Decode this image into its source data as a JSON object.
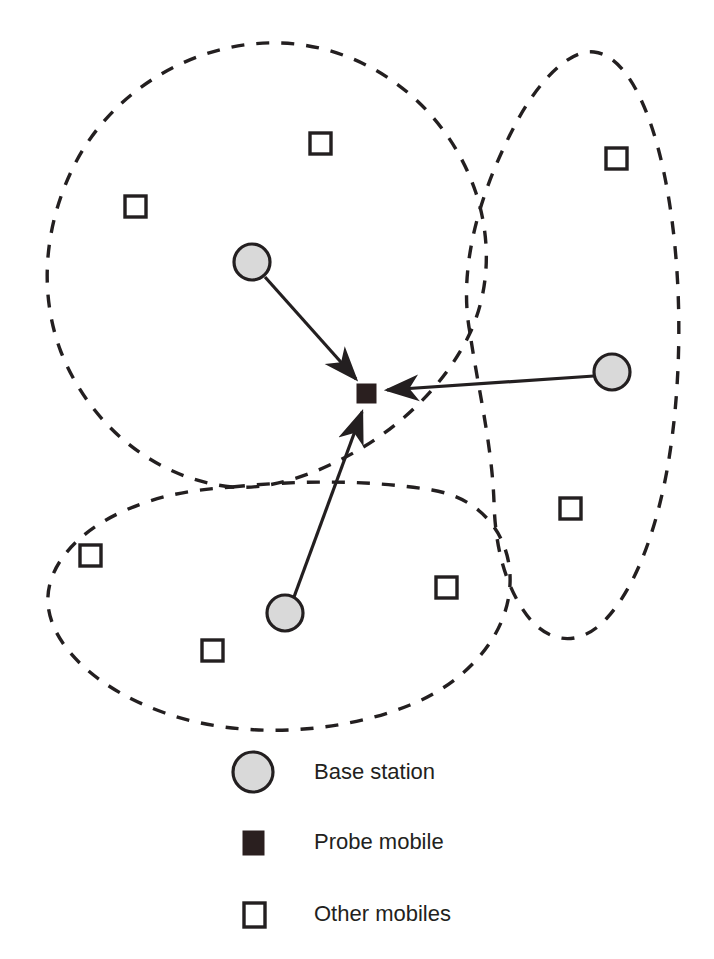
{
  "figure": {
    "background_color": "#ffffff",
    "ink_color": "#231f20",
    "base_station_fill": "#d9d9d9",
    "probe_fill": "#2a1f1f",
    "mobile_fill": "#ffffff"
  },
  "legend": {
    "items": [
      {
        "symbol": "circle",
        "label": "Base station"
      },
      {
        "symbol": "filled-square",
        "label": "Probe mobile"
      },
      {
        "symbol": "open-square",
        "label": "Other mobiles"
      }
    ]
  },
  "diagram": {
    "cells": [
      {
        "name": "upper-left-cell",
        "style": "dashed"
      },
      {
        "name": "right-cell",
        "style": "dashed"
      },
      {
        "name": "lower-left-cell",
        "style": "dashed"
      }
    ],
    "base_stations": [
      {
        "name": "base-station-upper-left",
        "x": 252,
        "y": 262,
        "r": 18
      },
      {
        "name": "base-station-right",
        "x": 612,
        "y": 372,
        "r": 18
      },
      {
        "name": "base-station-lower-left",
        "x": 285,
        "y": 613,
        "r": 18
      }
    ],
    "probe_mobile": {
      "name": "probe-mobile",
      "x": 367,
      "y": 393,
      "size": 19
    },
    "other_mobiles": [
      {
        "x": 320,
        "y": 143,
        "size": 21
      },
      {
        "x": 135,
        "y": 206,
        "size": 21
      },
      {
        "x": 616,
        "y": 158,
        "size": 21
      },
      {
        "x": 570,
        "y": 508,
        "size": 21
      },
      {
        "x": 90,
        "y": 555,
        "size": 21
      },
      {
        "x": 446,
        "y": 587,
        "size": 21
      },
      {
        "x": 212,
        "y": 650,
        "size": 21
      }
    ],
    "links": [
      {
        "name": "link-upper-left-to-probe",
        "from": "base-station-upper-left",
        "to": "probe-mobile",
        "arrow": "to-probe"
      },
      {
        "name": "link-right-to-probe",
        "from": "base-station-right",
        "to": "probe-mobile",
        "arrow": "to-probe"
      },
      {
        "name": "link-lower-left-to-probe",
        "from": "base-station-lower-left",
        "to": "probe-mobile",
        "arrow": "to-probe"
      }
    ]
  }
}
